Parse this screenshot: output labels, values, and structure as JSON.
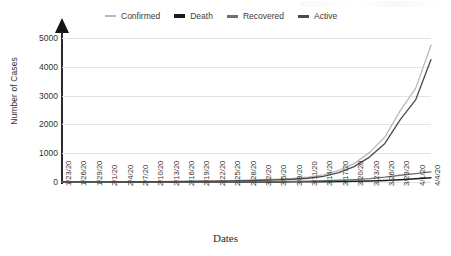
{
  "chart_data": {
    "type": "line",
    "title": "",
    "xlabel": "Dates",
    "ylabel": "Number of Cases",
    "ylim": [
      0,
      5000
    ],
    "yticks": [
      0,
      1000,
      2000,
      3000,
      4000,
      5000
    ],
    "grid": true,
    "legend_position": "top",
    "categories": [
      "1/23/20",
      "1/26/20",
      "1/29/20",
      "2/1/20",
      "2/4/20",
      "2/7/20",
      "2/10/20",
      "2/13/20",
      "2/16/20",
      "2/19/20",
      "2/22/20",
      "2/25/20",
      "2/28/20",
      "3/2/20",
      "3/5/20",
      "3/8/20",
      "3/11/20",
      "3/14/20",
      "3/17/20",
      "3/20/20",
      "3/23/20",
      "3/26/20",
      "3/29/20",
      "4/1/20",
      "4/4/20"
    ],
    "series": [
      {
        "name": "Confirmed",
        "color": "#b9b9b9",
        "values": [
          1,
          2,
          3,
          5,
          7,
          10,
          14,
          19,
          25,
          32,
          40,
          50,
          62,
          78,
          98,
          125,
          170,
          250,
          400,
          640,
          1020,
          1560,
          2480,
          3250,
          4750
        ]
      },
      {
        "name": "Death",
        "color": "#1c1c1c",
        "values": [
          0,
          0,
          0,
          0,
          0,
          0,
          0,
          0,
          0,
          1,
          1,
          2,
          2,
          3,
          4,
          5,
          7,
          10,
          14,
          22,
          35,
          52,
          78,
          110,
          150
        ]
      },
      {
        "name": "Recovered",
        "color": "#6f6f6f",
        "values": [
          0,
          0,
          0,
          0,
          1,
          1,
          2,
          3,
          4,
          5,
          7,
          9,
          12,
          15,
          19,
          24,
          32,
          44,
          60,
          85,
          120,
          170,
          235,
          290,
          350
        ]
      },
      {
        "name": "Active",
        "color": "#4a4a4a",
        "values": [
          1,
          2,
          3,
          5,
          6,
          9,
          12,
          16,
          21,
          26,
          32,
          39,
          48,
          60,
          75,
          96,
          131,
          196,
          326,
          533,
          865,
          1338,
          2167,
          2850,
          4250
        ]
      }
    ]
  },
  "legend": {
    "items": [
      {
        "label": "Confirmed",
        "color": "#b9b9b9"
      },
      {
        "label": "Death",
        "color": "#1c1c1c"
      },
      {
        "label": "Recovered",
        "color": "#6f6f6f"
      },
      {
        "label": "Active",
        "color": "#4a4a4a"
      }
    ]
  }
}
